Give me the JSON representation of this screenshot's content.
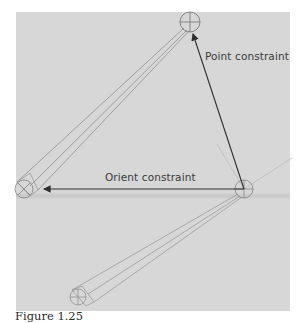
{
  "figure": {
    "caption": "Figure 1.25",
    "labels": {
      "point_constraint": "Point constraint",
      "orient_constraint": "Orient constraint"
    },
    "colors": {
      "background": "#d7d7d7",
      "arrow": "#2e2e2e",
      "bone": "#8a8a8a"
    },
    "joints": [
      {
        "name": "top-joint",
        "x": 190,
        "y": 22
      },
      {
        "name": "right-joint",
        "x": 244,
        "y": 189
      },
      {
        "name": "left-joint",
        "x": 24,
        "y": 189
      },
      {
        "name": "bottom-joint",
        "x": 78,
        "y": 297
      }
    ]
  }
}
